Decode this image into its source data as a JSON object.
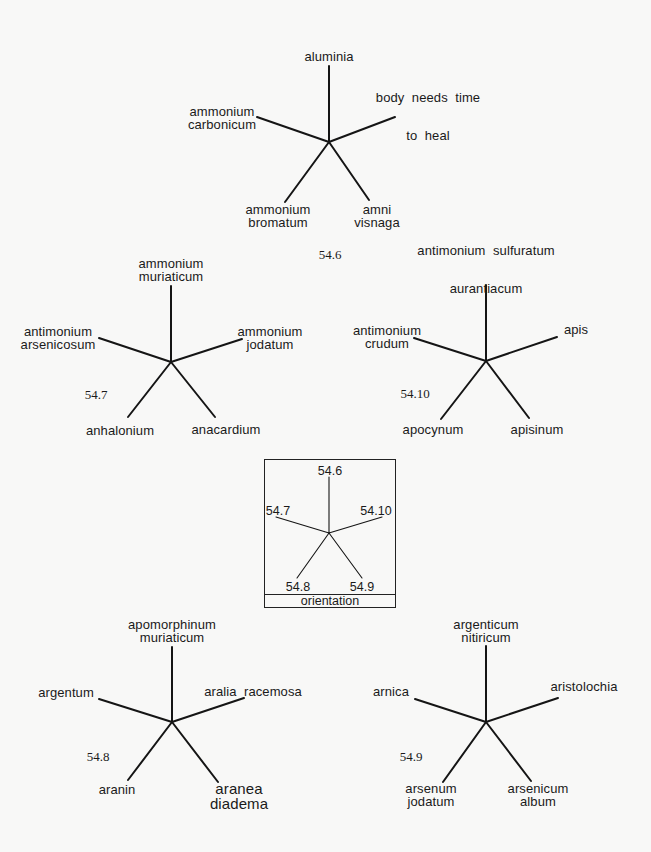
{
  "diagram": {
    "type": "star-orientation-diagram",
    "stars": [
      {
        "id": "54.6",
        "number": "54.6",
        "top": [
          "aluminia"
        ],
        "left": [
          "ammonium",
          "carbonicum"
        ],
        "right": [
          "body  needs  time",
          "to  heal"
        ],
        "bottom_left": [
          "ammonium",
          "bromatum"
        ],
        "bottom_right": [
          "amni",
          "visnaga"
        ]
      },
      {
        "id": "54.7",
        "number": "54.7",
        "top": [
          "ammonium",
          "muriaticum"
        ],
        "left": [
          "antimonium",
          "arsenicosum"
        ],
        "right": [
          "ammonium",
          "jodatum"
        ],
        "bottom_left": [
          "anhalonium"
        ],
        "bottom_right": [
          "anacardium"
        ]
      },
      {
        "id": "54.10",
        "number": "54.10",
        "top": [
          "antimonium  sulfuratum",
          "aurantiacum"
        ],
        "left": [
          "antimonium",
          "crudum"
        ],
        "right": [
          "apis"
        ],
        "bottom_left": [
          "apocynum"
        ],
        "bottom_right": [
          "apisinum"
        ]
      },
      {
        "id": "54.8",
        "number": "54.8",
        "top": [
          "apomorphinum",
          "muriaticum"
        ],
        "left": [
          "argentum"
        ],
        "right": [
          "aralia  racemosa"
        ],
        "bottom_left": [
          "aranin"
        ],
        "bottom_right": [
          "aranea",
          "diadema"
        ]
      },
      {
        "id": "54.9",
        "number": "54.9",
        "top": [
          "argenticum",
          "nitiricum"
        ],
        "left": [
          "arnica"
        ],
        "right": [
          "aristolochia"
        ],
        "bottom_left": [
          "arsenum",
          "jodatum"
        ],
        "bottom_right": [
          "arsenicum",
          "album"
        ]
      }
    ],
    "orientation": {
      "title": "orientation",
      "top": "54.6",
      "left": "54.7",
      "right": "54.10",
      "bottom_left": "54.8",
      "bottom_right": "54.9"
    }
  },
  "colors": {
    "background": "#f8f8f7",
    "ink": "#151515"
  }
}
